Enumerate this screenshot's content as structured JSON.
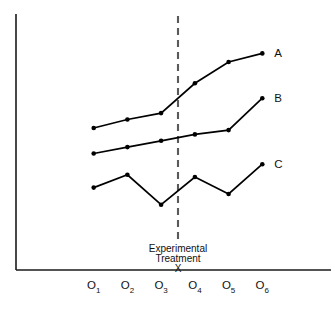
{
  "chart_data": {
    "type": "line",
    "title": "",
    "xlabel": "",
    "ylabel": "",
    "categories": [
      "O1",
      "O2",
      "O3",
      "O4",
      "O5",
      "O6"
    ],
    "category_labels": [
      {
        "base": "O",
        "sub": "1"
      },
      {
        "base": "O",
        "sub": "2"
      },
      {
        "base": "O",
        "sub": "3"
      },
      {
        "base": "O",
        "sub": "4"
      },
      {
        "base": "O",
        "sub": "5"
      },
      {
        "base": "O",
        "sub": "6"
      }
    ],
    "xlim": [
      0,
      7
    ],
    "ylim": [
      0,
      100
    ],
    "grid": false,
    "legend_position": "right-inline",
    "markers": true,
    "series": [
      {
        "name": "A",
        "label": "A",
        "color": "#000000",
        "values": [
          54,
          58,
          61,
          75,
          85,
          89
        ]
      },
      {
        "name": "B",
        "label": "B",
        "color": "#000000",
        "values": [
          42,
          45,
          48,
          51,
          53,
          68
        ]
      },
      {
        "name": "C",
        "label": "C",
        "color": "#000000",
        "values": [
          26,
          32,
          18,
          31,
          23,
          37
        ]
      }
    ],
    "annotations": [
      {
        "type": "vertical-dashed-line",
        "between": [
          "O3",
          "O4"
        ],
        "x": 3.5,
        "label_lines": [
          "Experimental",
          "Treatment",
          "X"
        ]
      }
    ]
  },
  "annotation": {
    "line1": "Experimental",
    "line2": "Treatment",
    "line3": "X"
  },
  "series_labels": {
    "a": "A",
    "b": "B",
    "c": "C"
  },
  "axis": {
    "ticks": [
      {
        "base": "O",
        "sub": "1"
      },
      {
        "base": "O",
        "sub": "2"
      },
      {
        "base": "O",
        "sub": "3"
      },
      {
        "base": "O",
        "sub": "4"
      },
      {
        "base": "O",
        "sub": "5"
      },
      {
        "base": "O",
        "sub": "6"
      }
    ]
  }
}
